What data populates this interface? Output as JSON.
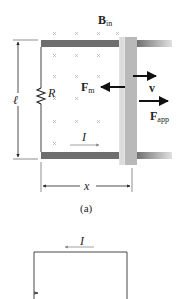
{
  "figure_a": {
    "field_label": "B",
    "field_sub": "in",
    "resistor_label": "R",
    "length_label": "ℓ",
    "magnetic_force_label": "F",
    "magnetic_force_sub": "m",
    "velocity_label": "v",
    "applied_force_label": "F",
    "applied_force_sub": "app",
    "current_label": "I",
    "distance_label": "x",
    "caption": "(a)"
  },
  "figure_b": {
    "current_label": "I"
  },
  "colors": {
    "rail": "#6e6e6e",
    "rod": "#b9b9b9",
    "rod_edge": "#d6d6d6",
    "wire": "#444444",
    "arrow": "#111111",
    "current_arrow": "#8a8a8a",
    "field_x": "#b0b0b0"
  }
}
